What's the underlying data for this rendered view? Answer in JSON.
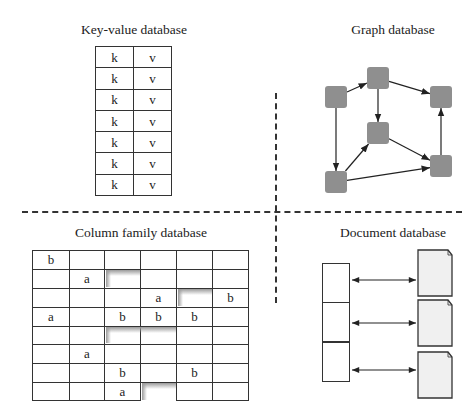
{
  "quadrants": {
    "key_value": {
      "title": "Key-value database",
      "rows": [
        {
          "key": "k",
          "value": "v"
        },
        {
          "key": "k",
          "value": "v"
        },
        {
          "key": "k",
          "value": "v"
        },
        {
          "key": "k",
          "value": "v"
        },
        {
          "key": "k",
          "value": "v"
        },
        {
          "key": "k",
          "value": "v"
        },
        {
          "key": "k",
          "value": "v"
        }
      ]
    },
    "graph": {
      "title": "Graph database",
      "node_color": "#8f8f8f",
      "nodes": [
        {
          "id": "n1",
          "x": 336,
          "y": 97
        },
        {
          "id": "n2",
          "x": 378,
          "y": 78
        },
        {
          "id": "n3",
          "x": 441,
          "y": 97
        },
        {
          "id": "n4",
          "x": 378,
          "y": 133
        },
        {
          "id": "n5",
          "x": 441,
          "y": 166
        },
        {
          "id": "n6",
          "x": 336,
          "y": 182
        }
      ],
      "edges": [
        {
          "from": "n1",
          "to": "n2"
        },
        {
          "from": "n1",
          "to": "n6"
        },
        {
          "from": "n2",
          "to": "n3"
        },
        {
          "from": "n2",
          "to": "n4"
        },
        {
          "from": "n4",
          "to": "n5"
        },
        {
          "from": "n6",
          "to": "n4"
        },
        {
          "from": "n6",
          "to": "n5"
        },
        {
          "from": "n5",
          "to": "n3"
        }
      ]
    },
    "column_family": {
      "title": "Column family database",
      "grid": [
        [
          "b",
          "",
          "",
          "",
          "",
          ""
        ],
        [
          "",
          "a",
          "",
          "",
          "",
          ""
        ],
        [
          "",
          "",
          "",
          "a",
          "",
          "b"
        ],
        [
          "a",
          "",
          "b",
          "b",
          "b",
          ""
        ],
        [
          "",
          "",
          "",
          "",
          "",
          ""
        ],
        [
          "",
          "a",
          "",
          "",
          "",
          ""
        ],
        [
          "",
          "",
          "b",
          "",
          "b",
          ""
        ],
        [
          "",
          "",
          "a",
          null,
          "",
          ""
        ]
      ]
    },
    "document": {
      "title": "Document database",
      "doc_fill": "#f0f0f0",
      "entries": 3
    }
  }
}
